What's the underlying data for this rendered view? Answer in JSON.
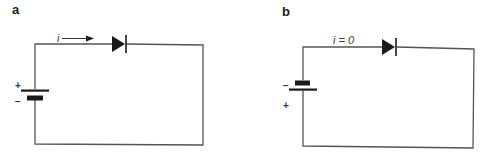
{
  "panels": [
    {
      "label": "a",
      "current_label": "i",
      "current_arrow": "right-arrow",
      "battery": {
        "top_sign": "+",
        "bottom_sign": "−"
      },
      "components": [
        "battery",
        "diode",
        "wire-loop"
      ]
    },
    {
      "label": "b",
      "current_label": "i = 0",
      "battery": {
        "top_sign": "−",
        "bottom_sign": "+"
      },
      "components": [
        "battery",
        "diode",
        "wire-loop"
      ]
    }
  ],
  "colors": {
    "wire": "#555555",
    "component": "#1a1a1a",
    "background": "#ffffff"
  }
}
